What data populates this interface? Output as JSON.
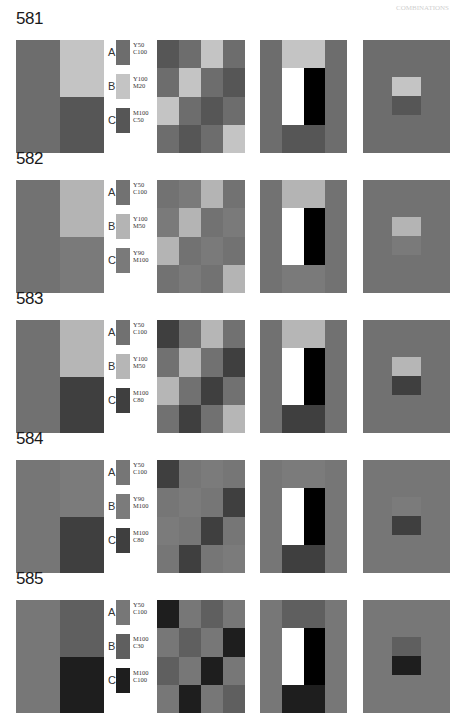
{
  "page": {
    "header_mark": "COMBINATIONS",
    "background": "#ffffff"
  },
  "sections": [
    {
      "number": "581",
      "colors": {
        "A": "#6d6d6d",
        "B": "#c4c4c4",
        "C": "#565656"
      },
      "swatches": [
        {
          "letter": "A",
          "spec": "Y50\nC100"
        },
        {
          "letter": "B",
          "spec": "Y100\nM20"
        },
        {
          "letter": "C",
          "spec": "M100\nC50"
        }
      ],
      "mosaic": [
        "C",
        "A",
        "B",
        "A",
        "A",
        "B",
        "A",
        "C",
        "B",
        "A",
        "C",
        "A",
        "A",
        "C",
        "A",
        "B"
      ]
    },
    {
      "number": "582",
      "colors": {
        "A": "#727272",
        "B": "#b4b4b4",
        "C": "#7a7a7a"
      },
      "swatches": [
        {
          "letter": "A",
          "spec": "Y50\nC100"
        },
        {
          "letter": "B",
          "spec": "Y100\nM50"
        },
        {
          "letter": "C",
          "spec": "Y90\nM100"
        }
      ],
      "mosaic": [
        "A",
        "C",
        "B",
        "A",
        "C",
        "B",
        "A",
        "C",
        "B",
        "A",
        "C",
        "A",
        "A",
        "C",
        "A",
        "B"
      ]
    },
    {
      "number": "583",
      "colors": {
        "A": "#717171",
        "B": "#b6b6b6",
        "C": "#3f3f3f"
      },
      "swatches": [
        {
          "letter": "A",
          "spec": "Y50\nC100"
        },
        {
          "letter": "B",
          "spec": "Y100\nM50"
        },
        {
          "letter": "C",
          "spec": "M100\nC80"
        }
      ],
      "mosaic": [
        "C",
        "A",
        "B",
        "A",
        "A",
        "B",
        "A",
        "C",
        "B",
        "A",
        "C",
        "A",
        "A",
        "C",
        "A",
        "B"
      ]
    },
    {
      "number": "584",
      "colors": {
        "A": "#767676",
        "B": "#7b7b7b",
        "C": "#3f3f3f"
      },
      "swatches": [
        {
          "letter": "A",
          "spec": "Y50\nC100"
        },
        {
          "letter": "B",
          "spec": "Y90\nM100"
        },
        {
          "letter": "C",
          "spec": "M100\nC80"
        }
      ],
      "mosaic": [
        "C",
        "A",
        "B",
        "A",
        "A",
        "B",
        "A",
        "C",
        "B",
        "A",
        "C",
        "A",
        "A",
        "C",
        "A",
        "B"
      ]
    },
    {
      "number": "585",
      "colors": {
        "A": "#777777",
        "B": "#5f5f5f",
        "C": "#1e1e1e"
      },
      "swatches": [
        {
          "letter": "A",
          "spec": "Y50\nC100"
        },
        {
          "letter": "B",
          "spec": "M100\nC30"
        },
        {
          "letter": "C",
          "spec": "M100\nC100"
        }
      ],
      "mosaic": [
        "C",
        "A",
        "B",
        "A",
        "A",
        "B",
        "A",
        "C",
        "B",
        "A",
        "C",
        "A",
        "A",
        "C",
        "A",
        "B"
      ]
    }
  ]
}
